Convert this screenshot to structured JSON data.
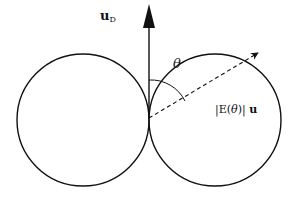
{
  "diagram": {
    "labels": {
      "dipole_axis": "u",
      "dipole_axis_sub": "D",
      "angle": "θ",
      "field_prefix": "|E(",
      "field_theta": "θ",
      "field_suffix": ")| ",
      "field_unit_vector": "u"
    },
    "colors": {
      "stroke": "#111111",
      "background": "#ffffff"
    }
  }
}
